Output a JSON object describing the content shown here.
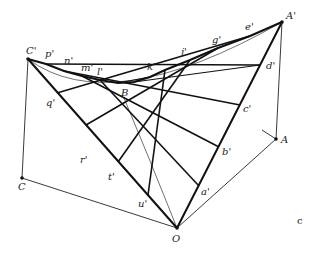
{
  "figure": {
    "type": "hyperbolic-paraboloid-ruled-surface",
    "panel_label": "c",
    "colors": {
      "line": "#111111",
      "background": "#ffffff"
    }
  },
  "points": {
    "A_prime": {
      "label": "A'",
      "x": 282,
      "y": 22
    },
    "C_prime": {
      "label": "C'",
      "x": 28,
      "y": 59
    },
    "O": {
      "label": "O",
      "x": 177,
      "y": 228
    },
    "A": {
      "label": "A",
      "x": 276,
      "y": 139
    },
    "C": {
      "label": "C",
      "x": 22,
      "y": 178
    },
    "B": {
      "label": "B",
      "x": 124,
      "y": 98
    }
  },
  "labels": {
    "A_prime": "A'",
    "C_prime": "C'",
    "O": "O",
    "A": "A",
    "C": "C",
    "B": "B",
    "p": "p'",
    "n": "n'",
    "m": "m'",
    "l": "l'",
    "k": "k'",
    "j": "j'",
    "g": "g'",
    "e": "e'",
    "d": "d'",
    "c": "c'",
    "b": "b'",
    "a": "a'",
    "q": "q'",
    "r": "r'",
    "t": "t'",
    "u": "u'",
    "panel": "c"
  }
}
